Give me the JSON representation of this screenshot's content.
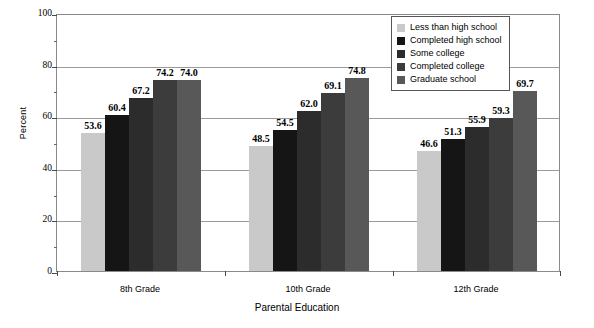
{
  "chart_data": {
    "type": "bar",
    "title": "",
    "xlabel": "Parental Education",
    "ylabel": "Percent",
    "ylim": [
      0,
      100
    ],
    "yticks": [
      0,
      20,
      40,
      60,
      80,
      100
    ],
    "grid": true,
    "legend_position": "top-right",
    "categories": [
      "8th Grade",
      "10th Grade",
      "12th Grade"
    ],
    "series": [
      {
        "name": "Less than high school",
        "color": "#c9c9c9",
        "values": [
          53.6,
          48.5,
          46.6
        ]
      },
      {
        "name": "Completed high school",
        "color": "#151515",
        "values": [
          60.4,
          54.5,
          51.3
        ]
      },
      {
        "name": "Some college",
        "color": "#2c2c2c",
        "values": [
          67.2,
          62.0,
          55.9
        ]
      },
      {
        "name": "Completed college",
        "color": "#3c3c3c",
        "values": [
          74.2,
          69.1,
          59.3
        ]
      },
      {
        "name": "Graduate school",
        "color": "#585858",
        "values": [
          74.0,
          74.8,
          69.7
        ]
      }
    ]
  },
  "axis": {
    "y_title": "Percent",
    "x_title": "Parental Education",
    "y_tick_labels": [
      "100",
      "80",
      "60",
      "40",
      "20",
      "0"
    ],
    "x_tick_labels": [
      "8th Grade",
      "10th Grade",
      "12th Grade"
    ]
  },
  "legend": {
    "items": [
      {
        "label": "Less than high school",
        "color": "#c9c9c9"
      },
      {
        "label": "Completed high school",
        "color": "#151515"
      },
      {
        "label": "Some college",
        "color": "#2c2c2c"
      },
      {
        "label": "Completed college",
        "color": "#3c3c3c"
      },
      {
        "label": "Graduate school",
        "color": "#585858"
      }
    ]
  }
}
